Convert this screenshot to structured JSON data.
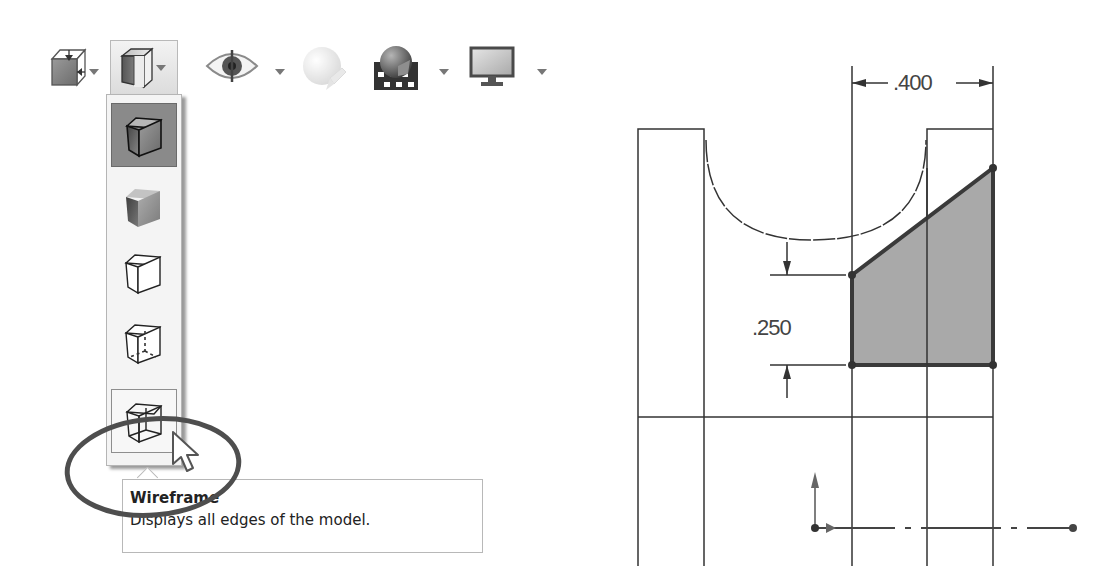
{
  "toolbar": {
    "items": [
      {
        "name": "view-orientation",
        "icon": "cube-orientation-icon",
        "has_dropdown": true
      },
      {
        "name": "display-style",
        "icon": "shaded-cube-icon",
        "has_dropdown": true,
        "active": true
      },
      {
        "name": "hide-show-items",
        "icon": "eye-icon",
        "has_dropdown": true
      },
      {
        "name": "edit-appearance",
        "icon": "appearance-sphere-icon",
        "has_dropdown": false,
        "disabled": true
      },
      {
        "name": "apply-scene",
        "icon": "scene-sphere-icon",
        "has_dropdown": true
      },
      {
        "name": "view-settings",
        "icon": "monitor-icon",
        "has_dropdown": true
      }
    ]
  },
  "display_style_menu": {
    "items": [
      {
        "name": "shaded-with-edges",
        "icon": "shaded-with-edges-icon",
        "state": "selected"
      },
      {
        "name": "shaded",
        "icon": "shaded-cube-icon",
        "state": "normal"
      },
      {
        "name": "hidden-lines-removed",
        "icon": "hidden-lines-removed-icon",
        "state": "normal"
      },
      {
        "name": "hidden-lines-visible",
        "icon": "hidden-lines-visible-icon",
        "state": "normal"
      },
      {
        "name": "wireframe",
        "icon": "wireframe-icon",
        "state": "hover"
      }
    ]
  },
  "tooltip": {
    "title": "Wireframe",
    "description": "Displays all edges of the model."
  },
  "annotation": {
    "type": "ellipse-highlight",
    "color": "#555555"
  },
  "drawing": {
    "dimensions": [
      {
        "name": "horizontal-dimension",
        "value": ".400"
      },
      {
        "name": "vertical-dimension",
        "value": ".250"
      }
    ],
    "fill_color": "#a9a9a9",
    "line_color": "#333333"
  }
}
